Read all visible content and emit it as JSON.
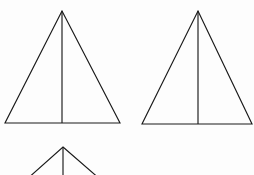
{
  "figure": {
    "background_color": "#fdfdfd",
    "stroke_color": "#1a1a1a",
    "stroke_width": 1.15,
    "canvas": {
      "width": 254,
      "height": 175
    }
  },
  "chart_data": {
    "type": "diagram",
    "xlabel": "",
    "ylabel": "",
    "xlim": [
      0,
      254
    ],
    "ylim": [
      0,
      175
    ],
    "grid": false,
    "legend": false,
    "shapes": [
      {
        "name": "triangle-top-left",
        "kind": "isosceles-triangle",
        "apex": [
          62,
          11
        ],
        "base_left": [
          5,
          123
        ],
        "base_right": [
          120,
          123
        ],
        "median": [
          [
            62,
            11
          ],
          [
            62,
            123
          ]
        ],
        "base_width": 115,
        "height": 112,
        "clipped": false
      },
      {
        "name": "triangle-top-right",
        "kind": "isosceles-triangle",
        "apex": [
          198,
          11
        ],
        "base_left": [
          142,
          124
        ],
        "base_right": [
          252,
          124
        ],
        "median": [
          [
            198,
            11
          ],
          [
            198,
            124
          ]
        ],
        "base_width": 110,
        "height": 113,
        "clipped": false
      },
      {
        "name": "triangle-bottom-center",
        "kind": "isosceles-triangle",
        "apex": [
          63,
          147
        ],
        "base_left": [
          26,
          180
        ],
        "base_right": [
          101,
          180
        ],
        "median": [
          [
            63,
            147
          ],
          [
            63,
            180
          ]
        ],
        "base_width": 75,
        "height": 33,
        "clipped": true,
        "clip_note": "cut off by bottom image edge at y=175"
      }
    ]
  }
}
